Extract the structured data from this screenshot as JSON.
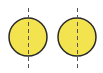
{
  "diagram": {
    "colors": {
      "fill": "#f2e34f",
      "stroke": "#2a2a2a",
      "dash": "#555555",
      "background": "#ffffff"
    },
    "shapes": [
      {
        "id": "left-circle",
        "cx": 28,
        "cy": 37,
        "r": 19,
        "axis_x": 28
      },
      {
        "id": "right-circle",
        "cx": 77,
        "cy": 37,
        "r": 19,
        "axis_x": 77
      }
    ]
  }
}
